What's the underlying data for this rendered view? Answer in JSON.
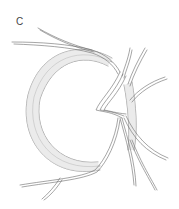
{
  "figure": {
    "panel_label": "C",
    "colors": {
      "stroke": "#6a6a6a",
      "fill_band": "#d9d9d9",
      "background": "#ffffff"
    }
  }
}
